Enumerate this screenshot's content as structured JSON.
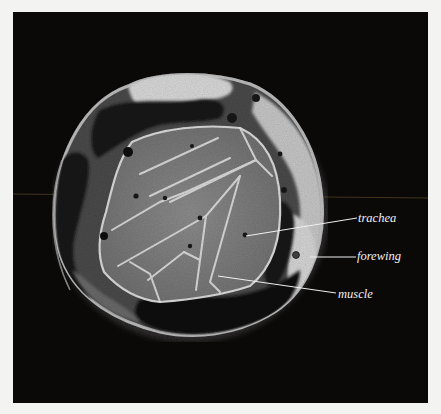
{
  "figure": {
    "type": "MRI cross-section",
    "background_color": "#0b0808",
    "page_color": "#f3f3f1",
    "labels": [
      {
        "id": "trachea",
        "text": "trachea"
      },
      {
        "id": "forewing",
        "text": "forewing"
      },
      {
        "id": "muscle",
        "text": "muscle"
      }
    ]
  }
}
